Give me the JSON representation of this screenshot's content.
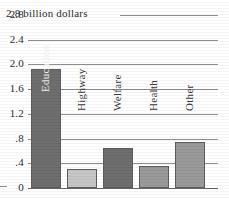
{
  "chart_data": {
    "type": "bar",
    "title": "",
    "subtitle": "",
    "xlabel": "",
    "ylabel": "billion dollars",
    "axis_note": "2.8 billion dollars",
    "categories": [
      "Education",
      "Highway",
      "Welfare",
      "Health",
      "Other"
    ],
    "values": [
      1.93,
      0.31,
      0.64,
      0.36,
      0.74
    ],
    "bar_colors": [
      "#6e6e6e",
      "#c6c6c6",
      "#6e6e6e",
      "#9a9a9a",
      "#9a9a9a"
    ],
    "ylim": [
      0,
      2.8
    ],
    "ytick_values": [
      2.8,
      2.4,
      2.0,
      1.6,
      1.2,
      0.8,
      0.4,
      0
    ],
    "ytick_labels": [
      "2.8",
      "2.4",
      "2.0",
      "1.6",
      "1.2",
      ".8",
      ".4",
      "0"
    ],
    "grid": true,
    "grid_axis": "y",
    "legend": false,
    "legend_position": "none",
    "value_label_position": "inside-rotated"
  },
  "colors": {
    "background": "#ffffff",
    "gridline": "#8e8e8e",
    "baseline": "#6a6a6a",
    "bar_outline": "#5c5c5c",
    "text": "#2b2b2b",
    "label_on_dark": "#f0f0f0",
    "label_on_light": "#3a3a3a"
  }
}
